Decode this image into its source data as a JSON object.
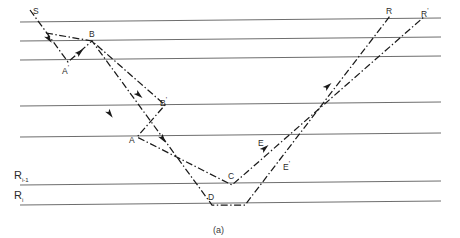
{
  "figure": {
    "caption": "(a)",
    "type": "seismic-ray-path-diagram",
    "interface_labels": [
      {
        "name": "R_i_minus_1",
        "text": "R",
        "sub": "i-1",
        "x": 14,
        "y": 170
      },
      {
        "name": "R_i",
        "text": "R",
        "sub": "i",
        "x": 14,
        "y": 190
      }
    ],
    "point_labels": [
      {
        "name": "S",
        "text": "S",
        "prime": false,
        "x": 33,
        "y": 7
      },
      {
        "name": "B",
        "text": "B",
        "prime": false,
        "x": 89,
        "y": 30
      },
      {
        "name": "Ap",
        "text": "A",
        "prime": true,
        "x": 62,
        "y": 64
      },
      {
        "name": "Bp",
        "text": "B",
        "prime": true,
        "x": 160,
        "y": 96
      },
      {
        "name": "A",
        "text": "A",
        "prime": false,
        "x": 129,
        "y": 136
      },
      {
        "name": "C",
        "text": "C",
        "prime": false,
        "x": 228,
        "y": 172
      },
      {
        "name": "D",
        "text": "D",
        "prime": false,
        "x": 208,
        "y": 193
      },
      {
        "name": "E",
        "text": "E",
        "prime": false,
        "x": 258,
        "y": 139
      },
      {
        "name": "Ep",
        "text": "E",
        "prime": true,
        "x": 283,
        "y": 160
      },
      {
        "name": "R",
        "text": "R",
        "prime": false,
        "x": 386,
        "y": 7
      },
      {
        "name": "Rp",
        "text": "R",
        "prime": true,
        "x": 421,
        "y": 7
      }
    ],
    "colors": {
      "interface_line": "#6e6e6e",
      "ray_line": "#1a1a1a",
      "label_text": "#2b2b2b"
    },
    "interfaces": [
      {
        "name": "layer-line-1",
        "x1": 20,
        "y1": 22,
        "x2": 441,
        "y2": 18
      },
      {
        "name": "layer-line-2",
        "x1": 20,
        "y1": 41,
        "x2": 441,
        "y2": 37
      },
      {
        "name": "layer-line-3",
        "x1": 20,
        "y1": 60,
        "x2": 441,
        "y2": 56
      },
      {
        "name": "layer-line-4",
        "x1": 20,
        "y1": 106,
        "x2": 441,
        "y2": 102
      },
      {
        "name": "layer-line-5",
        "x1": 20,
        "y1": 137,
        "x2": 441,
        "y2": 133
      },
      {
        "name": "layer-line-Ri-1",
        "x1": 20,
        "y1": 185,
        "x2": 441,
        "y2": 181
      },
      {
        "name": "layer-line-Ri",
        "x1": 20,
        "y1": 205,
        "x2": 441,
        "y2": 201
      }
    ],
    "rays": [
      {
        "name": "ray-path-primary",
        "points": "30,10 68,62 92,41 212,205 245,205 390,16"
      },
      {
        "name": "ray-path-secondary",
        "points": "46,33 92,41 165,105 137,137 232,185 247,172 425,16"
      }
    ],
    "arrows": [
      {
        "name": "arrow-1",
        "x": 49,
        "y": 39,
        "angle": 54
      },
      {
        "name": "arrow-2",
        "x": 80,
        "y": 52,
        "angle": -41
      },
      {
        "name": "arrow-3",
        "x": 139,
        "y": 95,
        "angle": 41
      },
      {
        "name": "arrow-4",
        "x": 110,
        "y": 114,
        "angle": 54
      },
      {
        "name": "arrow-5",
        "x": 163,
        "y": 139,
        "angle": 54
      },
      {
        "name": "arrow-6",
        "x": 265,
        "y": 148,
        "angle": -41
      },
      {
        "name": "arrow-7",
        "x": 328,
        "y": 86,
        "angle": -41
      }
    ]
  }
}
